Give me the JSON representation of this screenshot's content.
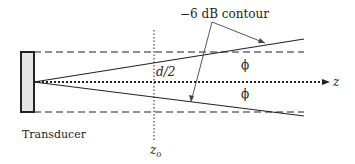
{
  "diagram": {
    "transducer_label": "Transducer",
    "contour_label": "−6 dB contour",
    "half_width_label": "d/2",
    "axis_label": "z",
    "position_label_main": "z",
    "position_label_sub": "0",
    "angle_label_upper": "ϕ",
    "angle_label_lower": "ϕ",
    "colors": {
      "stroke": "#222222",
      "transducer_fill": "#e6e6e6"
    }
  }
}
